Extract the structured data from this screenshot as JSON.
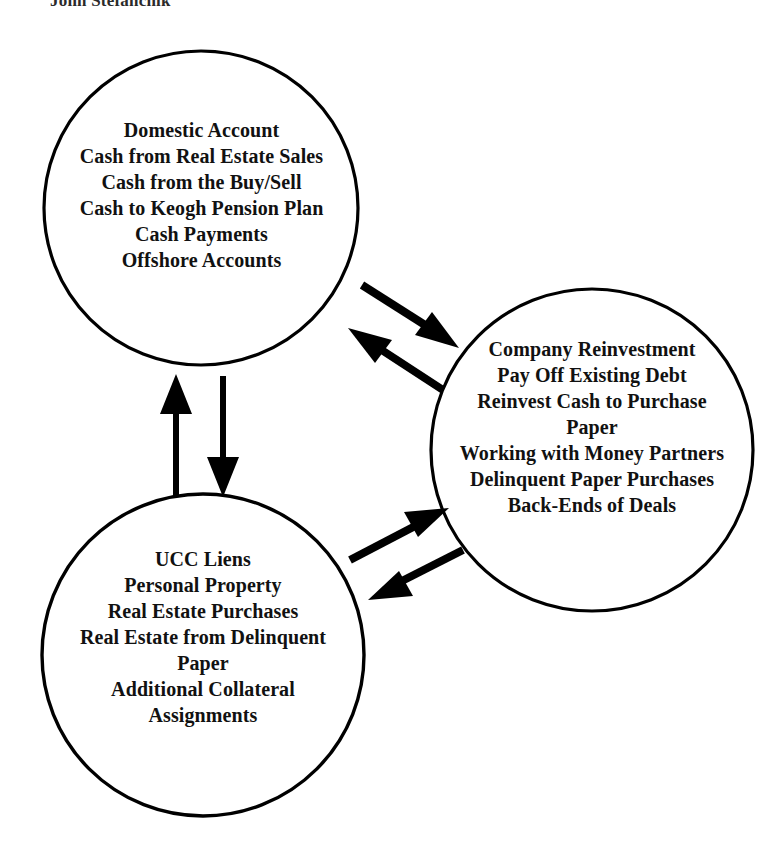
{
  "header": {
    "title": "John Stefanchik"
  },
  "diagram": {
    "type": "cycle-diagram",
    "shape": "circle",
    "stroke_color": "#000000",
    "fill_color": "#ffffff",
    "text_color": "#111111",
    "background_color": "#ffffff",
    "nodes": [
      {
        "id": "domestic-account",
        "name": "Domestic Account",
        "position": "top-left",
        "center": [
          201,
          208
        ],
        "radius": 158,
        "lines": [
          "Domestic Account",
          "Cash from Real Estate Sales",
          "Cash from the Buy/Sell",
          "Cash to Keogh Pension Plan",
          "Cash Payments",
          "Offshore Accounts"
        ]
      },
      {
        "id": "company-reinvestment",
        "name": "Company Reinvestment",
        "position": "right",
        "center": [
          592,
          450
        ],
        "radius": 162,
        "lines": [
          "Company Reinvestment",
          "Pay Off Existing Debt",
          "Reinvest Cash to Purchase",
          "Paper",
          "Working with Money Partners",
          "Delinquent Paper Purchases",
          "Back-Ends of Deals"
        ]
      },
      {
        "id": "ucc-liens",
        "name": "UCC Liens",
        "position": "bottom-left",
        "center": [
          203,
          655
        ],
        "radius": 162,
        "lines": [
          "UCC Liens",
          "Personal Property",
          "Real Estate Purchases",
          "Real Estate from Delinquent",
          "Paper",
          "Additional Collateral",
          "Assignments"
        ]
      }
    ],
    "arrows": [
      {
        "id": "arrow-domestic-to-company",
        "from": "domestic-account",
        "to": "company-reinvestment",
        "direction": "down-right",
        "start": [
          365,
          287
        ],
        "end": [
          455,
          345
        ]
      },
      {
        "id": "arrow-company-to-domestic",
        "from": "company-reinvestment",
        "to": "domestic-account",
        "direction": "up-left",
        "start": [
          440,
          388
        ],
        "end": [
          350,
          330
        ]
      },
      {
        "id": "arrow-ucc-to-domestic",
        "from": "ucc-liens",
        "to": "domestic-account",
        "direction": "up",
        "start": [
          176,
          494
        ],
        "end": [
          176,
          380
        ]
      },
      {
        "id": "arrow-domestic-to-ucc",
        "from": "domestic-account",
        "to": "ucc-liens",
        "direction": "down",
        "start": [
          223,
          378
        ],
        "end": [
          223,
          492
        ]
      },
      {
        "id": "arrow-ucc-to-company",
        "from": "ucc-liens",
        "to": "company-reinvestment",
        "direction": "up-right",
        "start": [
          352,
          558
        ],
        "end": [
          444,
          508
        ]
      },
      {
        "id": "arrow-company-to-ucc",
        "from": "company-reinvestment",
        "to": "ucc-liens",
        "direction": "down-left",
        "start": [
          460,
          551
        ],
        "end": [
          368,
          598
        ]
      }
    ]
  }
}
